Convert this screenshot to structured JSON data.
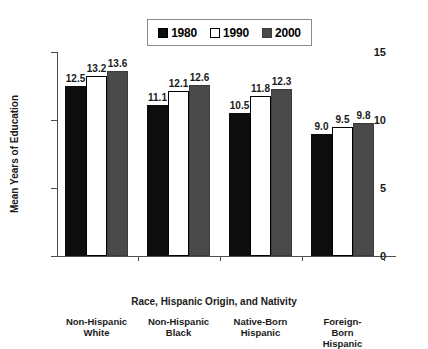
{
  "chart_data": {
    "type": "bar",
    "title": "",
    "xlabel": "Race, Hispanic Origin, and Nativity",
    "ylabel": "Mean Years of Education",
    "categories": [
      "Non-Hispanic\nWhite",
      "Non-Hispanic\nBlack",
      "Native-Born\nHispanic",
      "Foreign-Born\nHispanic"
    ],
    "series": [
      {
        "name": "1980",
        "values": [
          12.5,
          11.1,
          10.5,
          9.0
        ],
        "color": "#0d0d0d"
      },
      {
        "name": "1990",
        "values": [
          13.2,
          12.1,
          11.8,
          9.5
        ],
        "color": "#ffffff"
      },
      {
        "name": "2000",
        "values": [
          13.6,
          12.6,
          12.3,
          9.8
        ],
        "color": "#4a4a4a"
      }
    ],
    "value_labels": [
      [
        "12.5",
        "13.2",
        "13.6"
      ],
      [
        "11.1",
        "12.1",
        "12.6"
      ],
      [
        "10.5",
        "11.8",
        "12.3"
      ],
      [
        "9.0",
        "9.5",
        "9.8"
      ]
    ],
    "ylim": [
      0,
      15
    ],
    "yticks": [
      0,
      5,
      10,
      15
    ],
    "ytick_labels": [
      "0",
      "5",
      "10",
      "15"
    ],
    "grid": false,
    "legend_position": "top-center"
  },
  "legend": {
    "entries": [
      {
        "label": "1980",
        "swatch": "legend-swatch-1980"
      },
      {
        "label": "1990",
        "swatch": "legend-swatch-1990"
      },
      {
        "label": "2000",
        "swatch": "legend-swatch-2000"
      }
    ]
  }
}
